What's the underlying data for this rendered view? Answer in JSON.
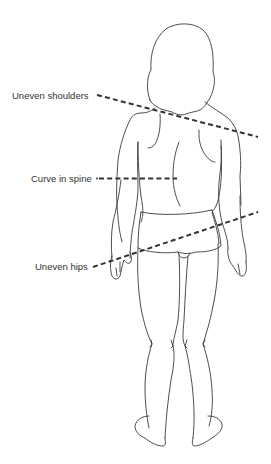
{
  "diagram": {
    "labels": [
      {
        "id": "shoulders",
        "text": "Uneven shoulders"
      },
      {
        "id": "spine",
        "text": "Curve in spine"
      },
      {
        "id": "hips",
        "text": "Uneven hips"
      }
    ],
    "colors": {
      "background": "#ffffff",
      "outline": "#3a3a3a",
      "indicator_line": "#333333",
      "label_text": "#333333"
    }
  }
}
